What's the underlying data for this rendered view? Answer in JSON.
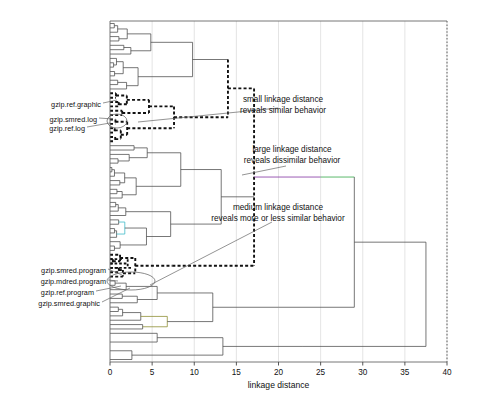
{
  "chart_data": {
    "type": "dendrogram",
    "title": "",
    "xlabel": "linkage distance",
    "ylabel": "",
    "xlim": [
      0,
      40
    ],
    "xticks": [
      0,
      5,
      10,
      15,
      20,
      25,
      30,
      35,
      40
    ],
    "xtick_labels": [
      "0",
      "5",
      "10",
      "15",
      "20",
      "25",
      "30",
      "35",
      "40"
    ],
    "grid": "vertical",
    "legend": "none",
    "n_leaves": 78,
    "orientation": "horizontal-left-root-right",
    "root_height": 37.5,
    "colors": {
      "line": "#4a4a4a",
      "highlight": "#111111",
      "grid": "#d8d8d8",
      "axis": "#555555",
      "green": "#3fae52",
      "blue": "#3a62c8",
      "purple": "#8a3fa8",
      "olive": "#8a8a2a",
      "cyan": "#35b7c6",
      "red": "#c03a3a"
    },
    "annotations": [
      {
        "id": "small",
        "lines": [
          "small  linkage  distance",
          "reveals similar  behavior"
        ],
        "text_x": 283,
        "text_y": 102,
        "leader": [
          [
            278,
            108
          ],
          [
            138,
            122
          ]
        ]
      },
      {
        "id": "large",
        "lines": [
          "large linkage  distance",
          "reveals dissimilar  behavior"
        ],
        "text_x": 292,
        "text_y": 152,
        "leader": [
          [
            286,
            166
          ],
          [
            242,
            175
          ]
        ]
      },
      {
        "id": "medium",
        "lines": [
          "medium linkage  distance",
          "reveals more or less  similar  behavior"
        ],
        "text_x": 278,
        "text_y": 210,
        "leader": [
          [
            272,
            222
          ],
          [
            150,
            285
          ]
        ]
      }
    ],
    "leaf_labels_upper": [
      {
        "text": "gzip.ref.graphic",
        "x": 101,
        "y": 104,
        "leader": [
          [
            103,
            103
          ],
          [
            117,
            100
          ]
        ]
      },
      {
        "text": "gzip.smred.log",
        "x": 97,
        "y": 119,
        "leader": [
          [
            99,
            118
          ],
          [
            113,
            119
          ]
        ]
      },
      {
        "text": "gzip.ref.log",
        "x": 85,
        "y": 128,
        "leader": [
          [
            87,
            127
          ],
          [
            110,
            123
          ]
        ]
      }
    ],
    "leaf_labels_lower": [
      {
        "text": "gzip.smred.program",
        "x": 106,
        "y": 270,
        "leader": [
          [
            108,
            269
          ],
          [
            122,
            275
          ]
        ]
      },
      {
        "text": "gzip.mdred.program",
        "x": 106,
        "y": 281,
        "leader": [
          [
            108,
            280
          ],
          [
            118,
            281
          ]
        ]
      },
      {
        "text": "gzip.ref.program",
        "x": 94,
        "y": 292,
        "leader": [
          [
            96,
            291
          ],
          [
            121,
            286
          ]
        ]
      },
      {
        "text": "gzip.smred.graphic",
        "x": 100,
        "y": 303,
        "leader": [
          [
            102,
            302
          ],
          [
            130,
            288
          ]
        ]
      }
    ],
    "ellipses": [
      {
        "id": "upper-cluster-ellipse",
        "cx": 117,
        "cy": 121,
        "rx": 10,
        "ry": 7
      },
      {
        "id": "lower-cluster-ellipse",
        "cx": 131,
        "cy": 281,
        "rx": 24,
        "ry": 9
      }
    ],
    "plot_box": {
      "left": 110,
      "right": 447,
      "top": 21,
      "bottom": 362
    }
  },
  "axis": {
    "title": "linkage distance",
    "tick_labels": [
      "0",
      "5",
      "10",
      "15",
      "20",
      "25",
      "30",
      "35",
      "40"
    ]
  }
}
